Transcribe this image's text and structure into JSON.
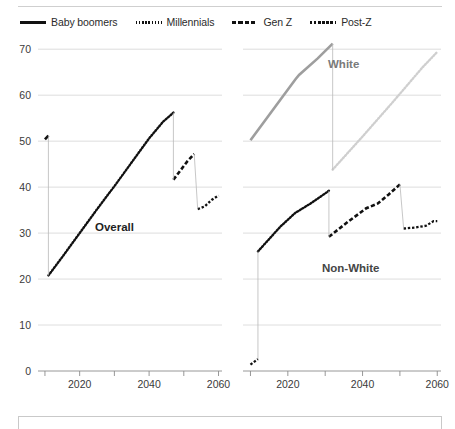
{
  "legend": {
    "items": [
      {
        "label": "Baby boomers",
        "style": "solid",
        "icon": "line-solid-icon"
      },
      {
        "label": "Millennials",
        "style": "dotted",
        "icon": "line-dotted-icon"
      },
      {
        "label": "Gen Z",
        "style": "dashed",
        "icon": "line-dashed-icon"
      },
      {
        "label": "Post-Z",
        "style": "dashdot",
        "icon": "line-dashdot-icon"
      }
    ]
  },
  "axis": {
    "y_ticks": [
      "0",
      "10",
      "20",
      "30",
      "40",
      "50",
      "60",
      "70"
    ],
    "x_ticks_labeled": [
      "2020",
      "2040",
      "2060"
    ],
    "x_ticks_all": [
      "2010",
      "2020",
      "2030",
      "2040",
      "2050",
      "2060"
    ]
  },
  "panels": {
    "left_label": "Overall",
    "right_label_top": "White",
    "right_label_bottom": "Non-White"
  },
  "colors": {
    "ink": "#111111",
    "gray_line": "#9e9e9e",
    "light_gray_line": "#cfcfcf",
    "grid": "#d9d9d9",
    "axis": "#8c8c8c",
    "label_muted": "#7a7a7a"
  },
  "chart_data": {
    "type": "line",
    "title": "",
    "xlabel": "",
    "ylabel": "",
    "xlim": [
      2008,
      2061
    ],
    "ylim": [
      0,
      72
    ],
    "grid": true,
    "legend_position": "top-left",
    "panels": [
      {
        "name": "Overall",
        "label": "Overall",
        "series": [
          {
            "name": "Baby boomers",
            "style": "solid",
            "color": "#111111",
            "x": [
              2010,
              2011
            ],
            "values": [
              50.4,
              51.2
            ]
          },
          {
            "name": "Millennials",
            "style": "dotted",
            "color": "#111111",
            "x": [
              2011,
              2015,
              2020,
              2025,
              2030,
              2035,
              2040,
              2044,
              2047
            ],
            "values": [
              20.8,
              24.8,
              30.0,
              35.2,
              40.2,
              45.4,
              50.6,
              54.2,
              56.2
            ]
          },
          {
            "name": "Gen Z",
            "style": "dashed",
            "color": "#111111",
            "x": [
              2047,
              2049,
              2051,
              2053
            ],
            "values": [
              41.6,
              43.6,
              45.6,
              47.2
            ]
          },
          {
            "name": "Post-Z",
            "style": "dashdot",
            "color": "#111111",
            "x": [
              2054,
              2056,
              2058,
              2060
            ],
            "values": [
              35.2,
              35.8,
              37.2,
              38.2
            ]
          }
        ]
      },
      {
        "name": "White",
        "label": "White",
        "series": [
          {
            "name": "Baby boomers",
            "style": "solid",
            "color": "#9e9e9e",
            "x": [
              2010,
              2018,
              2022,
              2023,
              2028,
              2032
            ],
            "values": [
              50.2,
              59.0,
              63.4,
              64.4,
              68.0,
              71.2
            ]
          },
          {
            "name": "Millennials",
            "style": "dotted",
            "color": "#cfcfcf",
            "x": [
              2032,
              2040,
              2048,
              2056,
              2060
            ],
            "values": [
              43.8,
              51.0,
              58.4,
              66.0,
              69.4
            ]
          }
        ]
      },
      {
        "name": "Non-White",
        "label": "Non-White",
        "series": [
          {
            "name": "Baby boomers",
            "style": "dashdot",
            "color": "#111111",
            "x": [
              2010,
              2012
            ],
            "values": [
              1.4,
              2.6
            ]
          },
          {
            "name": "Millennials",
            "style": "dotted",
            "color": "#111111",
            "x": [
              2012,
              2018,
              2022,
              2026,
              2031
            ],
            "values": [
              26.0,
              31.4,
              34.4,
              36.4,
              39.2
            ]
          },
          {
            "name": "Gen Z",
            "style": "dashed",
            "color": "#111111",
            "x": [
              2031,
              2036,
              2041,
              2044,
              2047,
              2050
            ],
            "values": [
              29.2,
              32.4,
              35.4,
              36.4,
              38.4,
              40.6
            ]
          },
          {
            "name": "Post-Z",
            "style": "dashdot",
            "color": "#111111",
            "x": [
              2051,
              2054,
              2057,
              2059,
              2060
            ],
            "values": [
              31.0,
              31.2,
              31.6,
              32.6,
              32.6
            ]
          }
        ]
      }
    ]
  }
}
